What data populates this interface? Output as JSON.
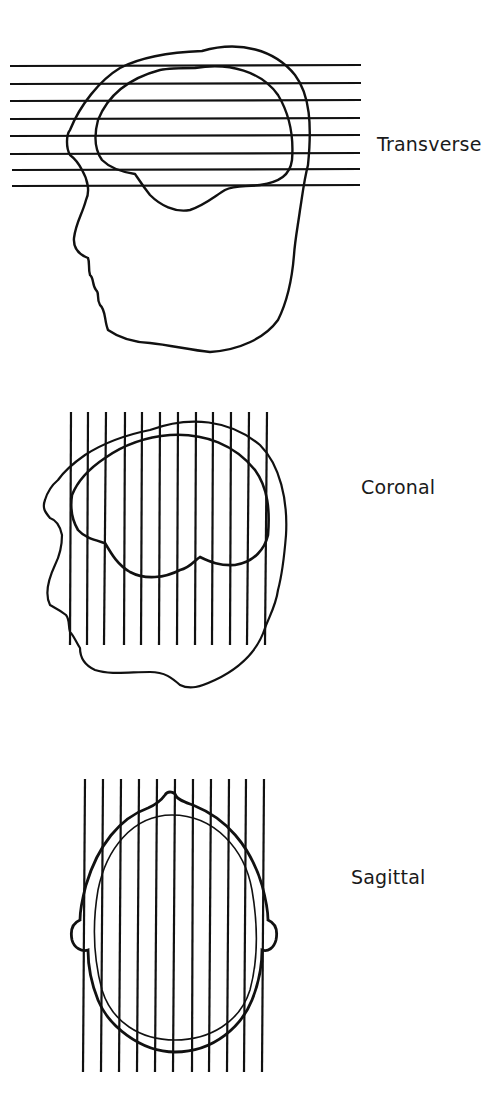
{
  "figure": {
    "panels": [
      {
        "id": "transverse",
        "label": "Transverse",
        "view": "lateral head profile",
        "line_orientation": "horizontal",
        "line_count": 8
      },
      {
        "id": "coronal",
        "label": "Coronal",
        "view": "lateral head profile",
        "line_orientation": "vertical",
        "line_count": 12
      },
      {
        "id": "sagittal",
        "label": "Sagittal",
        "view": "top-down head view",
        "line_orientation": "vertical",
        "line_count": 11
      }
    ],
    "colors": {
      "stroke": "#111111",
      "background": "#ffffff"
    }
  }
}
